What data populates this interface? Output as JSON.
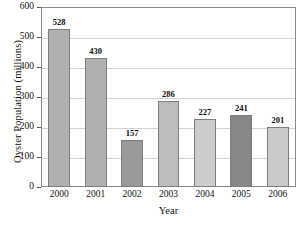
{
  "chart_data": {
    "type": "bar",
    "title": "",
    "xlabel": "Year",
    "ylabel": "Oyster Population (millions)",
    "categories": [
      "2000",
      "2001",
      "2002",
      "2003",
      "2004",
      "2005",
      "2006"
    ],
    "values": [
      528,
      430,
      157,
      286,
      227,
      241,
      201
    ],
    "value_labels": [
      "528",
      "430",
      "157",
      "286",
      "227",
      "241",
      "201"
    ],
    "bar_colors": [
      "#b0b0b0",
      "#b0b0b0",
      "#9a9a9a",
      "#bdbdbd",
      "#cccccc",
      "#878787",
      "#c9c9c9"
    ],
    "ylim": [
      0,
      600
    ],
    "yticks": [
      0,
      100,
      200,
      300,
      400,
      500,
      600
    ],
    "ytick_labels": [
      "0",
      "100",
      "200",
      "300",
      "400",
      "500",
      "600"
    ],
    "grid": true,
    "grid_color": "#d3d3d3",
    "legend": null,
    "border_color": "#8a8a8a",
    "background": "#ffffff"
  }
}
